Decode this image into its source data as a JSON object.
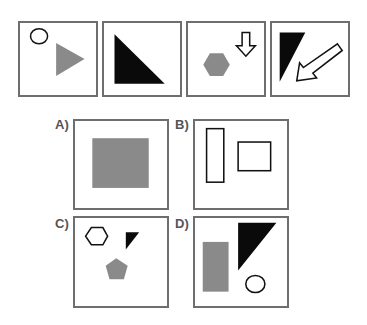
{
  "colors": {
    "gray": "#8a8a8a",
    "black": "#0a0a0a",
    "outline": "#111111",
    "frame": "#6e6e6e"
  },
  "sequence": [
    {
      "id": 1,
      "shapes": [
        "outline circle",
        "gray triangle pointing right"
      ]
    },
    {
      "id": 2,
      "shapes": [
        "black right triangle"
      ]
    },
    {
      "id": 3,
      "shapes": [
        "gray hexagon",
        "outline down arrow"
      ]
    },
    {
      "id": 4,
      "shapes": [
        "black triangle",
        "outline arrow pointing down-left"
      ]
    }
  ],
  "options": [
    {
      "label": "A)",
      "shapes": [
        "gray square"
      ]
    },
    {
      "label": "B)",
      "shapes": [
        "outline tall rectangle",
        "outline rectangle"
      ]
    },
    {
      "label": "C)",
      "shapes": [
        "outline hexagon",
        "black small triangle",
        "gray pentagon"
      ]
    },
    {
      "label": "D)",
      "shapes": [
        "gray rectangle",
        "black triangle",
        "outline circle"
      ]
    }
  ]
}
